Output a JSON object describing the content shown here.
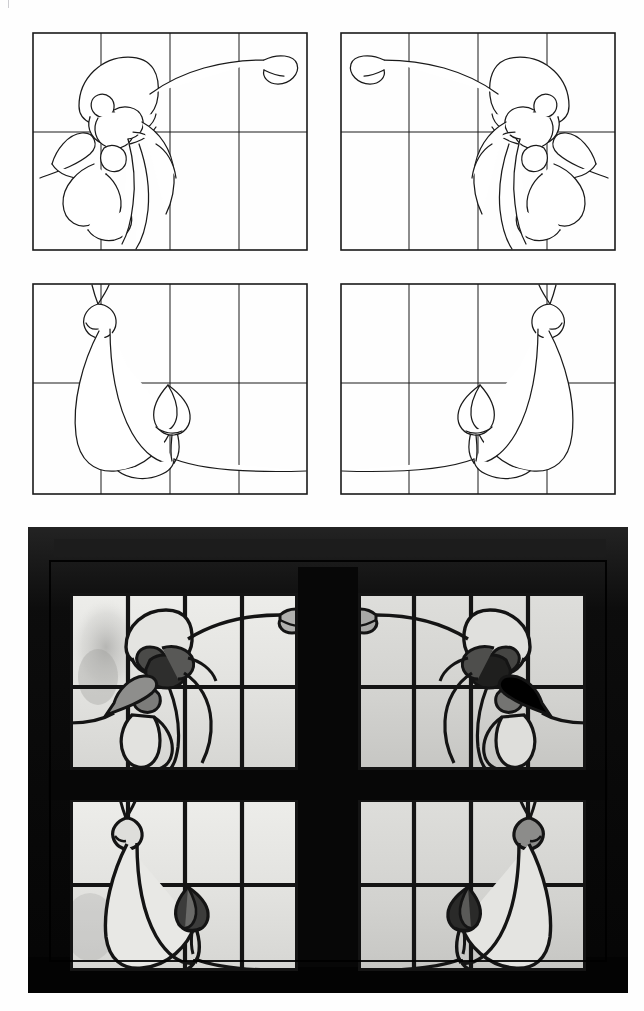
{
  "document": {
    "title": "Stained Glass Window Design Sheet",
    "page_background": "#ffffff",
    "header_fragments": [
      "",
      "",
      "",
      ""
    ]
  },
  "ink": {
    "line_color": "#1a1a1a",
    "grid_color": "#1a1a1a",
    "panel_border_color": "#111111",
    "photo_frame_color": "#0b0b0b",
    "lead_color": "#141414",
    "glass_clear": "#e9e9e6",
    "glass_light_grey": "#d3d3d0",
    "glass_mid_grey": "#9a9a98",
    "glass_dark_grey": "#6e6e6c",
    "glass_darkest": "#3a3a39"
  },
  "drawings": {
    "label": "Line drawings of leaded glass cartoon",
    "panel_count": 4,
    "grid_columns": 4,
    "grid_rows": 2,
    "panels": [
      {
        "id": "top-left",
        "name": "Upper left cartoon — blossom at left, tendril sweeping right to bud",
        "motif": "blossom-left",
        "mirrored": false,
        "row": 1,
        "column": 1
      },
      {
        "id": "top-right",
        "name": "Upper right cartoon — blossom at right, tendril sweeping left to bud",
        "motif": "blossom-right",
        "mirrored": true,
        "row": 1,
        "column": 2
      },
      {
        "id": "middle-left",
        "name": "Lower left cartoon — crescent leaf with teardrop bud",
        "motif": "crescent-left",
        "mirrored": false,
        "row": 2,
        "column": 1
      },
      {
        "id": "middle-right",
        "name": "Lower right cartoon — crescent leaf mirrored with teardrop bud",
        "motif": "crescent-right",
        "mirrored": true,
        "row": 2,
        "column": 2
      }
    ]
  },
  "photograph": {
    "label": "Photograph of the completed leaded stained glass window",
    "description": "Four-light window in a black frame, two lights above and two below, showing the executed design",
    "frame_color": "#0b0b0b",
    "lights": [
      {
        "id": "photo-top-left",
        "name": "Installed light, upper left",
        "motif": "blossom-left"
      },
      {
        "id": "photo-top-right",
        "name": "Installed light, upper right",
        "motif": "blossom-right"
      },
      {
        "id": "photo-bottom-left",
        "name": "Installed light, lower left",
        "motif": "crescent-left"
      },
      {
        "id": "photo-bottom-right",
        "name": "Installed light, lower right",
        "motif": "crescent-right"
      }
    ]
  }
}
